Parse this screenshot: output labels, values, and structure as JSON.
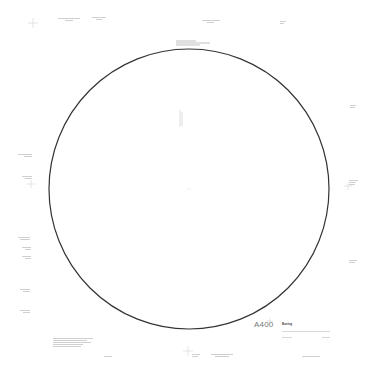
{
  "drawing": {
    "part_label": "A400",
    "brand_mark": "Boeing",
    "circle": {
      "cx": 189,
      "cy": 189,
      "r": 140,
      "stroke": "#333333"
    }
  },
  "annotations": {
    "top": [
      {
        "id": "top-left-1",
        "text": ""
      },
      {
        "id": "top-left-2",
        "text": ""
      },
      {
        "id": "top-center",
        "text": ""
      },
      {
        "id": "top-right",
        "text": ""
      },
      {
        "id": "circle-top-note",
        "text": ""
      }
    ],
    "left": [
      {
        "id": "left-1",
        "text": ""
      },
      {
        "id": "left-2",
        "text": ""
      },
      {
        "id": "left-3",
        "text": ""
      },
      {
        "id": "left-4",
        "text": ""
      },
      {
        "id": "left-5",
        "text": ""
      },
      {
        "id": "left-6",
        "text": ""
      },
      {
        "id": "left-7",
        "text": ""
      }
    ],
    "right": [
      {
        "id": "right-1",
        "text": ""
      },
      {
        "id": "right-2",
        "text": ""
      },
      {
        "id": "right-3",
        "text": ""
      }
    ],
    "bottom": [
      {
        "id": "bottom-notes",
        "text": ""
      },
      {
        "id": "bottom-1",
        "text": ""
      },
      {
        "id": "bottom-2",
        "text": ""
      },
      {
        "id": "bottom-3",
        "text": ""
      },
      {
        "id": "bottom-4",
        "text": ""
      }
    ]
  }
}
